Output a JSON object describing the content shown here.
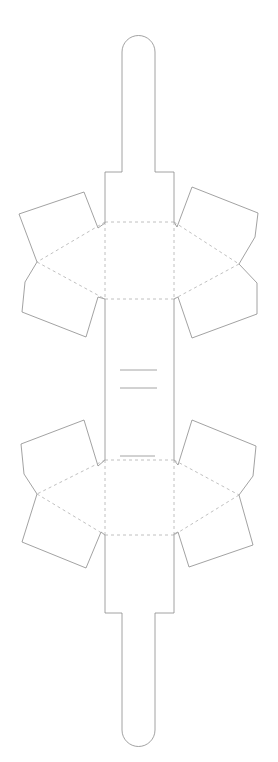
{
  "diagram": {
    "type": "papercraft-dieline",
    "width": 278,
    "height": 762,
    "colors": {
      "background": "#ffffff",
      "cut_line": "#8a8a8a",
      "fold_line": "#b0b0b0",
      "mark_line": "#9a9a9a"
    },
    "outline": {
      "top_tab": "M105,172 L122,172 L122,52 A16.5,16.5 0 0 1 155,52 L155,172 L174,172",
      "bottom_tab": "M105,613 L122,613 L122,730 A16.5,16.5 0 0 0 155,730 L155,613 L174,613",
      "body_left": [
        "M105,172 L105,223",
        "M105,299 L105,460",
        "M105,535 L105,613"
      ],
      "body_right": [
        "M174,172 L174,222",
        "M174,299 L174,460",
        "M174,534 L174,613"
      ]
    },
    "flaps": [
      {
        "name": "upper-left-flap",
        "path": "M105,223 L98,228 L84,192 L19,214 L37,262 L25,282 L22,312 L86,337 L98,297 L105,299"
      },
      {
        "name": "upper-right-flap",
        "path": "M174,222 L177,227 L192,187 L258,213 L255,237 L239,264 L257,283 L257,314 L192,338 L178,297 L174,299"
      },
      {
        "name": "lower-left-flap",
        "path": "M105,460 L98,466 L84,420 L21,444 L24,474 L37,494 L22,542 L86,568 L101,532 L105,535"
      },
      {
        "name": "lower-right-flap",
        "path": "M174,460 L178,465 L192,420 L256,446 L253,476 L239,495 L253,545 L189,567 L178,532 L174,534"
      }
    ],
    "folds": [
      {
        "name": "upper-top-fold",
        "path": "M105,222 L174,222"
      },
      {
        "name": "upper-bottom-fold",
        "path": "M105,299 L174,299"
      },
      {
        "name": "upper-left-diag-top",
        "path": "M105,222 L37,262"
      },
      {
        "name": "upper-left-diag-bottom",
        "path": "M37,262 L105,299"
      },
      {
        "name": "upper-right-diag-top",
        "path": "M174,222 L239,264"
      },
      {
        "name": "upper-right-diag-bottom",
        "path": "M239,264 L174,299"
      },
      {
        "name": "upper-left-vertical",
        "path": "M105,222 L105,299"
      },
      {
        "name": "upper-right-vertical",
        "path": "M174,222 L174,299"
      },
      {
        "name": "lower-top-fold",
        "path": "M105,460 L174,460"
      },
      {
        "name": "lower-bottom-fold",
        "path": "M105,535 L174,535"
      },
      {
        "name": "lower-left-diag-top",
        "path": "M105,460 L37,494"
      },
      {
        "name": "lower-left-diag-bottom",
        "path": "M37,494 L105,535"
      },
      {
        "name": "lower-right-diag-top",
        "path": "M174,460 L239,495"
      },
      {
        "name": "lower-right-diag-bottom",
        "path": "M239,495 L174,535"
      },
      {
        "name": "lower-left-vertical",
        "path": "M105,460 L105,535"
      },
      {
        "name": "lower-right-vertical",
        "path": "M174,460 L174,535"
      }
    ],
    "marks": [
      {
        "name": "slot-mark-1",
        "path": "M120,370 L157,370"
      },
      {
        "name": "slot-mark-2",
        "path": "M120,388 L157,388"
      },
      {
        "name": "slot-mark-3",
        "path": "M120,456 L155,456"
      }
    ]
  }
}
